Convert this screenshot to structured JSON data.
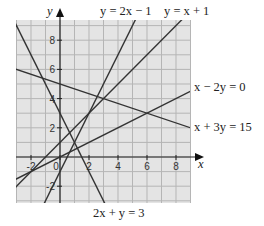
{
  "chart_data": {
    "type": "line",
    "title": "",
    "xlabel": "x",
    "ylabel": "y",
    "xlim": [
      -3,
      9
    ],
    "ylim": [
      -3.2,
      9.4
    ],
    "grid": true,
    "x_ticks": [
      -2,
      0,
      2,
      4,
      6,
      8
    ],
    "y_ticks": [
      -2,
      2,
      4,
      6,
      8
    ],
    "x_tick_labels": [
      "-2",
      "0",
      "2",
      "4",
      "6",
      "8"
    ],
    "y_tick_labels": [
      "-2",
      "2",
      "4",
      "6",
      "8"
    ],
    "series": [
      {
        "name": "y = 2x − 1",
        "slope": 2,
        "intercept": -1
      },
      {
        "name": "y = x + 1",
        "slope": 1,
        "intercept": 1
      },
      {
        "name": "x − 2y = 0",
        "slope": 0.5,
        "intercept": 0
      },
      {
        "name": "x + 3y = 15",
        "slope": -0.3333,
        "intercept": 5
      },
      {
        "name": "2x + y = 3",
        "slope": -2,
        "intercept": 3
      }
    ]
  },
  "labels": {
    "y_axis": "y",
    "x_axis": "x",
    "line1": "y = 2x − 1",
    "line2": "y = x + 1",
    "line3": "x − 2y = 0",
    "line4": "x + 3y = 15",
    "line5": "2x + y = 3"
  }
}
